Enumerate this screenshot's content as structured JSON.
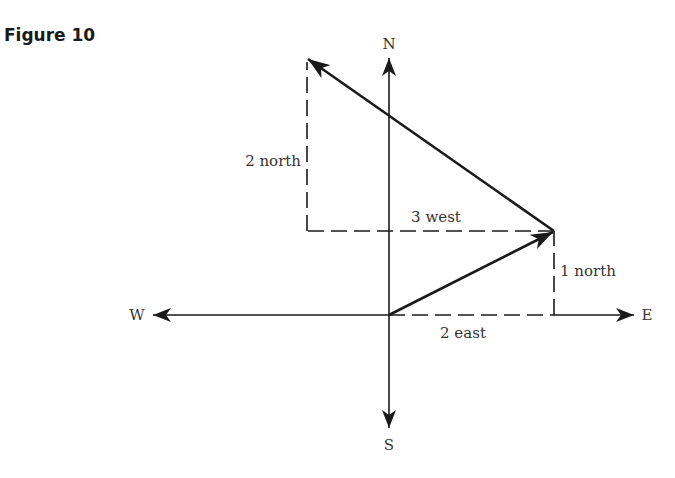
{
  "figure": {
    "title": "Figure 10"
  },
  "compass": {
    "north": "N",
    "south": "S",
    "east": "E",
    "west": "W"
  },
  "labels": {
    "two_north": "2 north",
    "three_west": "3 west",
    "one_north": "1 north",
    "two_east": "2 east"
  },
  "vectors": [
    {
      "name": "first-displacement",
      "from": [
        0,
        0
      ],
      "to": [
        2,
        1
      ],
      "components": [
        "2 east",
        "1 north"
      ]
    },
    {
      "name": "second-displacement",
      "from": [
        2,
        1
      ],
      "to": [
        -1,
        3
      ],
      "components": [
        "3 west",
        "2 north"
      ]
    }
  ],
  "colors": {
    "ink": "#1a1a1a",
    "text": "#333333",
    "background": "#ffffff"
  }
}
